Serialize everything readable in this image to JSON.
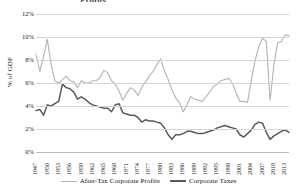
{
  "title_fragment": "Profits",
  "axes": {
    "ylabel": "% of GDP",
    "yticks": [
      "0%",
      "2%",
      "4%",
      "6%",
      "8%",
      "10%",
      "12%"
    ],
    "xticks": [
      "1947",
      "1950",
      "1953",
      "1956",
      "1959",
      "1962",
      "1965",
      "1968",
      "1971",
      "1974",
      "1977",
      "1980",
      "1983",
      "1986",
      "1989",
      "1992",
      "1995",
      "1998",
      "2001",
      "2004",
      "2007",
      "2010",
      "2013"
    ]
  },
  "legend": {
    "items": [
      {
        "label": "After-Tax Corporate Profits",
        "color": "#b3b3b3"
      },
      {
        "label": "Corporate Taxes",
        "color": "#595959"
      }
    ]
  },
  "chart_data": {
    "type": "line",
    "title": "",
    "xlabel": "",
    "ylabel": "% of GDP",
    "ylim": [
      0,
      12
    ],
    "xlim": [
      1947,
      2014
    ],
    "grid": true,
    "legend_position": "bottom",
    "x": [
      1947,
      1948,
      1949,
      1950,
      1951,
      1952,
      1953,
      1954,
      1955,
      1956,
      1957,
      1958,
      1959,
      1960,
      1961,
      1962,
      1963,
      1964,
      1965,
      1966,
      1967,
      1968,
      1969,
      1970,
      1971,
      1972,
      1973,
      1974,
      1975,
      1976,
      1977,
      1978,
      1979,
      1980,
      1981,
      1982,
      1983,
      1984,
      1985,
      1986,
      1987,
      1988,
      1989,
      1990,
      1991,
      1992,
      1993,
      1994,
      1995,
      1996,
      1997,
      1998,
      1999,
      2000,
      2001,
      2002,
      2003,
      2004,
      2005,
      2006,
      2007,
      2008,
      2009,
      2010,
      2011,
      2012,
      2013,
      2014
    ],
    "series": [
      {
        "name": "After-Tax Corporate Profits",
        "color": "#b3b3b3",
        "values": [
          8.5,
          7.0,
          8.3,
          9.8,
          7.6,
          6.2,
          6.0,
          6.3,
          6.6,
          6.2,
          6.1,
          5.6,
          6.2,
          6.0,
          6.0,
          6.2,
          6.2,
          6.5,
          7.1,
          6.9,
          6.2,
          5.9,
          5.3,
          4.5,
          5.1,
          5.6,
          5.4,
          4.9,
          5.6,
          6.1,
          6.6,
          7.0,
          7.6,
          8.1,
          7.1,
          6.3,
          5.4,
          4.7,
          4.3,
          3.5,
          4.1,
          4.8,
          4.6,
          4.5,
          4.4,
          4.8,
          5.2,
          5.7,
          5.9,
          6.2,
          6.3,
          6.4,
          6.0,
          5.1,
          4.4,
          4.4,
          4.3,
          6.2,
          7.9,
          9.2,
          9.9,
          9.6,
          4.5,
          7.6,
          9.5,
          9.6,
          10.2,
          10.1
        ]
      },
      {
        "name": "Corporate Taxes",
        "color": "#595959",
        "values": [
          3.6,
          3.7,
          3.2,
          4.1,
          4.0,
          4.2,
          4.4,
          5.9,
          5.6,
          5.5,
          5.2,
          4.6,
          4.8,
          4.6,
          4.3,
          4.1,
          4.0,
          3.9,
          3.8,
          3.8,
          3.5,
          4.1,
          4.2,
          3.4,
          3.3,
          3.2,
          3.2,
          3.0,
          2.6,
          2.8,
          2.7,
          2.7,
          2.6,
          2.5,
          2.1,
          1.5,
          1.1,
          1.5,
          1.5,
          1.6,
          1.8,
          1.8,
          1.7,
          1.6,
          1.6,
          1.7,
          1.8,
          1.9,
          2.1,
          2.2,
          2.3,
          2.2,
          2.1,
          2.0,
          1.5,
          1.3,
          1.6,
          1.9,
          2.4,
          2.6,
          2.5,
          1.7,
          1.1,
          1.4,
          1.6,
          1.8,
          1.9,
          1.7
        ]
      }
    ]
  }
}
